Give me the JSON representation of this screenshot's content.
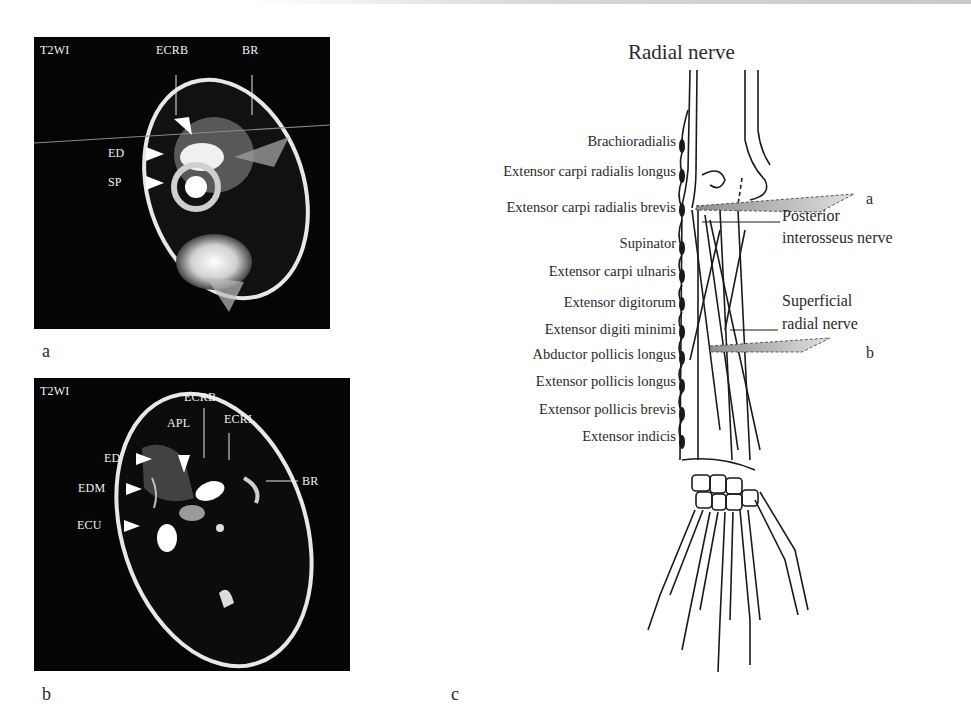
{
  "figure": {
    "panels": [
      {
        "id": "a",
        "label": "a",
        "type": "MRI axial image",
        "sequence": "T2WI",
        "annotations": [
          {
            "text": "ECRB",
            "marker": "line"
          },
          {
            "text": "BR",
            "marker": "line"
          },
          {
            "text": "ED",
            "marker": "arrowhead"
          },
          {
            "text": "SP",
            "marker": "arrowhead"
          }
        ]
      },
      {
        "id": "b",
        "label": "b",
        "type": "MRI axial image",
        "sequence": "T2WI",
        "annotations": [
          {
            "text": "ECRB",
            "marker": "line"
          },
          {
            "text": "APL",
            "marker": "arrowhead"
          },
          {
            "text": "ECRL",
            "marker": "line"
          },
          {
            "text": "ED",
            "marker": "arrowhead"
          },
          {
            "text": "EDM",
            "marker": "arrowhead"
          },
          {
            "text": "ECU",
            "marker": "arrowhead"
          },
          {
            "text": "BR",
            "marker": "line"
          }
        ]
      },
      {
        "id": "c",
        "label": "c",
        "type": "anatomical diagram",
        "title": "Radial nerve",
        "muscle_branches": [
          "Brachioradialis",
          "Extensor carpi radialis longus",
          "Extensor carpi radialis brevis",
          "Supinator",
          "Extensor carpi ulnaris",
          "Extensor digitorum",
          "Extensor digiti minimi",
          "Abductor pollicis longus",
          "Extensor pollicis longus",
          "Extensor pollicis brevis",
          "Extensor indicis"
        ],
        "nerve_labels": {
          "posterior_line1": "Posterior",
          "posterior_line2": "interosseus nerve",
          "superficial_line1": "Superficial",
          "superficial_line2": "radial nerve"
        },
        "section_planes": {
          "plane_a": "a",
          "plane_b": "b"
        }
      }
    ]
  },
  "colors": {
    "mri_background": "#050505",
    "mri_text": "#f2f2f2",
    "ink": "#2a2a2a",
    "plane_fill": "#bdbdbd"
  }
}
